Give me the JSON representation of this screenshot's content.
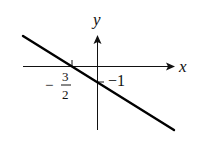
{
  "diagram": {
    "type": "linear-function-graph",
    "axes": {
      "x_label": "x",
      "y_label": "y"
    },
    "intercepts": {
      "x_intercept_label": "3",
      "x_intercept_denominator": "2",
      "x_intercept_sign": "−",
      "y_intercept_label": "−1"
    },
    "line": {
      "slope_direction": "decreasing",
      "color": "#000000"
    }
  }
}
